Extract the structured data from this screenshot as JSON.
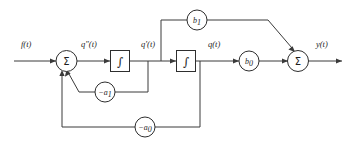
{
  "diagram": {
    "type": "control-block-diagram",
    "signals": {
      "input": "f(t)",
      "second_derivative": "qʺ(t)",
      "first_derivative": "qʹ(t)",
      "state": "q(t)",
      "output": "y(t)"
    },
    "blocks": {
      "summer_input": "Σ",
      "summer_output": "Σ",
      "integrator_1": "∫",
      "integrator_2": "∫",
      "gain_b1_base": "b",
      "gain_b1_sub": "1",
      "gain_b0_base": "b",
      "gain_b0_sub": "0",
      "gain_a1_base": "−a",
      "gain_a1_sub": "1",
      "gain_a0_base": "−a",
      "gain_a0_sub": "0"
    },
    "colors": {
      "wire": "#3a3a3a",
      "outline": "#2e2e2e",
      "text": "#1e1e1e",
      "background": "#ffffff"
    }
  }
}
